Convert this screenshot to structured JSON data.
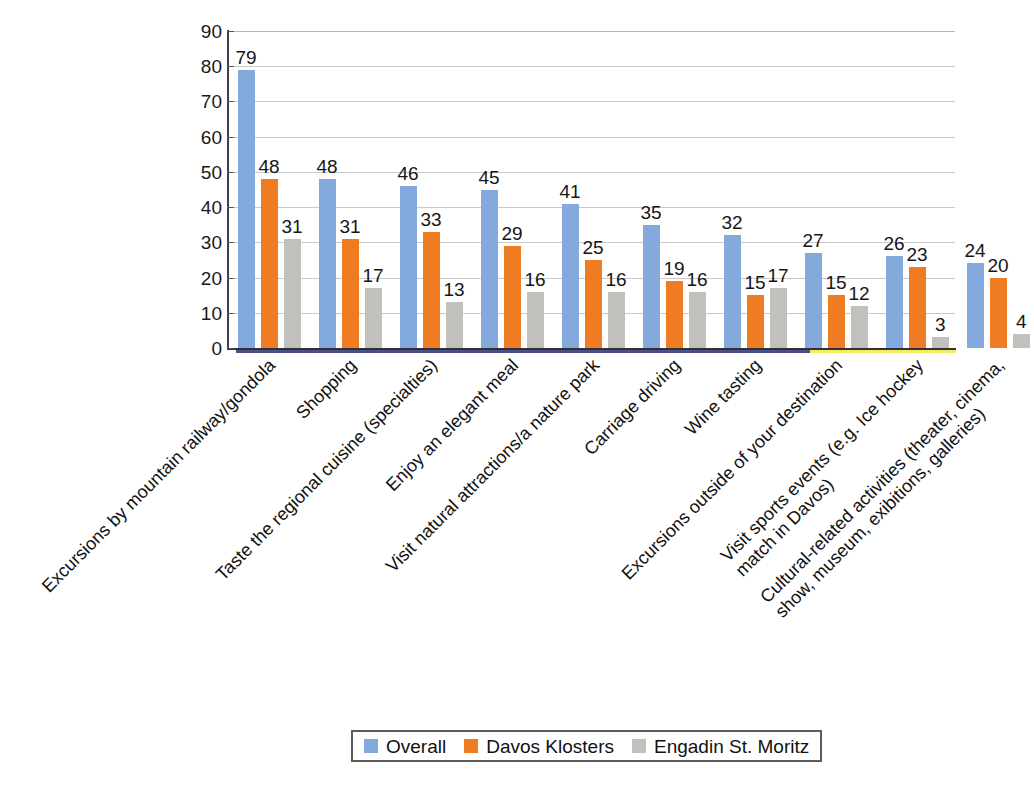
{
  "chart_data": {
    "type": "bar",
    "title": "",
    "subtitle": "",
    "xlabel": "",
    "ylabel": "",
    "ylim": [
      0,
      90
    ],
    "ytick_step": 10,
    "yticks": [
      "90",
      "80",
      "70",
      "60",
      "50",
      "40",
      "30",
      "20",
      "10",
      "0"
    ],
    "grid": true,
    "legend_position": "bottom",
    "show_value_labels": true,
    "categories": [
      "Excursions by mountain railway/gondola",
      "Shopping",
      "Taste the regional cuisine (specialties)",
      "Enjoy an elegant meal",
      "Visit natural attractions/a nature park",
      "Carriage driving",
      "Wine tasting",
      "Excursions outside of your destination",
      "Visit sports events (e.g. Ice hockey\nmatch in Davos)",
      "Cultural-related activities (theater, cinema,\nshow, museum, exibitions, galleries)"
    ],
    "series": [
      {
        "name": "Overall",
        "color": "#84aadd",
        "values": [
          79,
          48,
          46,
          45,
          41,
          35,
          32,
          27,
          26,
          24
        ]
      },
      {
        "name": "Davos Klosters",
        "color": "#ef7c22",
        "values": [
          48,
          31,
          33,
          29,
          25,
          19,
          15,
          15,
          23,
          20
        ]
      },
      {
        "name": "Engadin St. Moritz",
        "color": "#c2c0bb",
        "values": [
          31,
          17,
          13,
          16,
          16,
          16,
          17,
          12,
          3,
          4
        ]
      }
    ]
  },
  "legend": {
    "items": [
      {
        "label": "Overall",
        "color": "#84aadd"
      },
      {
        "label": "Davos Klosters",
        "color": "#ef7c22"
      },
      {
        "label": "Engadin St. Moritz",
        "color": "#c2c0bb"
      }
    ]
  }
}
